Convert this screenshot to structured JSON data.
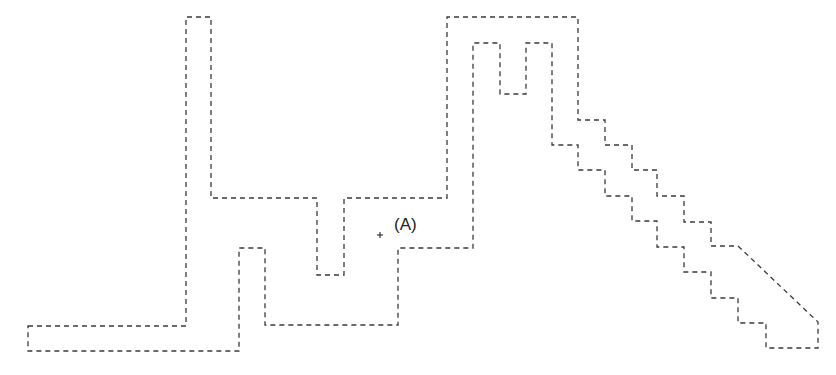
{
  "diagram": {
    "type": "floor-plan-outline",
    "stroke_color": "#3a3a3a",
    "background": "#ffffff",
    "outline_points": [
      [
        28,
        326
      ],
      [
        186,
        326
      ],
      [
        186,
        17
      ],
      [
        211,
        17
      ],
      [
        211,
        198
      ],
      [
        317,
        198
      ],
      [
        317,
        275
      ],
      [
        344,
        275
      ],
      [
        344,
        198
      ],
      [
        447,
        198
      ],
      [
        447,
        17
      ],
      [
        578,
        17
      ],
      [
        578,
        120
      ],
      [
        605,
        120
      ],
      [
        605,
        145
      ],
      [
        632,
        145
      ],
      [
        632,
        170
      ],
      [
        657,
        170
      ],
      [
        657,
        196
      ],
      [
        684,
        196
      ],
      [
        684,
        222
      ],
      [
        711,
        222
      ],
      [
        711,
        246
      ],
      [
        738,
        246
      ],
      [
        818,
        322
      ],
      [
        818,
        348
      ],
      [
        766,
        348
      ],
      [
        766,
        323
      ],
      [
        738,
        323
      ],
      [
        738,
        298
      ],
      [
        711,
        298
      ],
      [
        711,
        272
      ],
      [
        684,
        272
      ],
      [
        684,
        247
      ],
      [
        657,
        247
      ],
      [
        657,
        221
      ],
      [
        632,
        221
      ],
      [
        632,
        196
      ],
      [
        605,
        196
      ],
      [
        605,
        170
      ],
      [
        578,
        170
      ],
      [
        578,
        145
      ],
      [
        552,
        145
      ],
      [
        552,
        43
      ],
      [
        526,
        43
      ],
      [
        526,
        94
      ],
      [
        500,
        94
      ],
      [
        500,
        43
      ],
      [
        473,
        43
      ],
      [
        473,
        248
      ],
      [
        398,
        248
      ],
      [
        398,
        325
      ],
      [
        265,
        325
      ],
      [
        265,
        248
      ],
      [
        239,
        248
      ],
      [
        239,
        351
      ],
      [
        28,
        351
      ]
    ],
    "point_marker": {
      "symbol": "+",
      "x": 380,
      "y": 235
    },
    "point_label": {
      "text": "(A)",
      "x": 394,
      "y": 230
    }
  }
}
